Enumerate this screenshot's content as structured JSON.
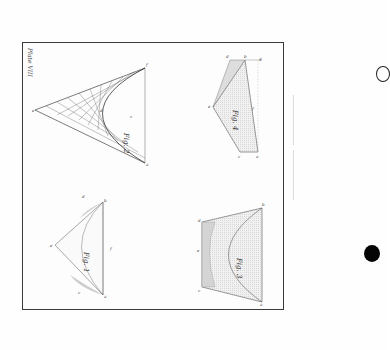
{
  "plate": {
    "title": "Plate VIII",
    "orientation": "rotated 90 degrees clockwise"
  },
  "figures": [
    {
      "id": "fig-1",
      "caption": "Fig. 1",
      "labels": [
        "a",
        "b",
        "c",
        "d",
        "e",
        "f"
      ]
    },
    {
      "id": "fig-2",
      "caption": "Fig. 2",
      "labels": [
        "a",
        "b",
        "c",
        "d",
        "e"
      ]
    },
    {
      "id": "fig-3",
      "caption": "Fig. 3",
      "labels": [
        "a",
        "b",
        "c",
        "d",
        "e"
      ]
    },
    {
      "id": "fig-4",
      "caption": "Fig. 4",
      "labels": [
        "a",
        "b",
        "c",
        "d",
        "e",
        "f",
        "g"
      ]
    }
  ],
  "binding_holes": [
    {
      "style": "outline"
    },
    {
      "style": "filled"
    }
  ],
  "colors": {
    "ink": "#333333",
    "shade": "#e8e8e8",
    "frame": "#3a3a3a",
    "paper": "#fefefe"
  }
}
